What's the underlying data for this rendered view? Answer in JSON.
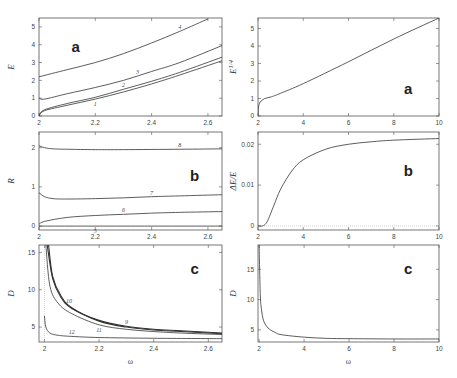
{
  "chart_data": [
    {
      "id": "left-a",
      "type": "line",
      "panel_label": "a",
      "xlabel": "",
      "ylabel": "E",
      "xlim": [
        2,
        2.65
      ],
      "ylim": [
        0,
        5.5
      ],
      "xticks": [
        "2",
        "2.2",
        "2.4",
        "2.6"
      ],
      "yticks": [
        "0",
        "1",
        "2",
        "3",
        "4",
        "5"
      ],
      "series": [
        {
          "name": "1",
          "x": [
            2.0,
            2.02,
            2.1,
            2.2,
            2.3,
            2.4,
            2.5,
            2.65
          ],
          "y": [
            0.0,
            0.3,
            0.6,
            0.95,
            1.35,
            1.8,
            2.3,
            3.1
          ]
        },
        {
          "name": "2",
          "x": [
            2.0,
            2.02,
            2.1,
            2.2,
            2.3,
            2.4,
            2.5,
            2.65
          ],
          "y": [
            0.05,
            0.35,
            0.7,
            1.05,
            1.5,
            1.95,
            2.45,
            3.3
          ]
        },
        {
          "name": "3",
          "x": [
            2.0,
            2.02,
            2.1,
            2.2,
            2.3,
            2.4,
            2.5,
            2.65
          ],
          "y": [
            1.0,
            0.95,
            1.25,
            1.6,
            2.0,
            2.5,
            3.0,
            3.95
          ]
        },
        {
          "name": "4",
          "x": [
            2.0,
            2.1,
            2.2,
            2.3,
            2.4,
            2.5,
            2.6
          ],
          "y": [
            2.2,
            2.6,
            3.0,
            3.5,
            4.1,
            4.75,
            5.45
          ]
        }
      ]
    },
    {
      "id": "left-b",
      "type": "line",
      "panel_label": "b",
      "xlabel": "",
      "ylabel": "R",
      "xlim": [
        2,
        2.65
      ],
      "ylim": [
        -0.1,
        2.4
      ],
      "xticks": [
        "2",
        "2.2",
        "2.4",
        "2.6"
      ],
      "yticks": [
        "0",
        "1",
        "2"
      ],
      "series": [
        {
          "name": "5",
          "x": [
            2.0,
            2.65
          ],
          "y": [
            0.0,
            0.0
          ]
        },
        {
          "name": "6",
          "x": [
            2.0,
            2.02,
            2.1,
            2.2,
            2.3,
            2.4,
            2.5,
            2.65
          ],
          "y": [
            0.05,
            0.12,
            0.22,
            0.27,
            0.3,
            0.33,
            0.35,
            0.37
          ]
        },
        {
          "name": "7",
          "x": [
            2.0,
            2.02,
            2.05,
            2.1,
            2.2,
            2.3,
            2.4,
            2.5,
            2.65
          ],
          "y": [
            0.85,
            0.75,
            0.7,
            0.69,
            0.7,
            0.72,
            0.75,
            0.77,
            0.8
          ]
        },
        {
          "name": "8",
          "x": [
            2.0,
            2.02,
            2.05,
            2.1,
            2.2,
            2.3,
            2.5,
            2.65
          ],
          "y": [
            2.05,
            2.0,
            1.97,
            1.96,
            1.95,
            1.95,
            1.96,
            1.97
          ]
        }
      ]
    },
    {
      "id": "left-c",
      "type": "line",
      "panel_label": "c",
      "xlabel": "ω",
      "ylabel": "D",
      "xlim": [
        1.98,
        2.65
      ],
      "ylim": [
        3,
        16
      ],
      "xticks": [
        "2",
        "2.2",
        "2.4",
        "2.6"
      ],
      "yticks": [
        "5",
        "10",
        "15"
      ],
      "series": [
        {
          "name": "9",
          "x": [
            2.01,
            2.03,
            2.06,
            2.1,
            2.2,
            2.3,
            2.4,
            2.5,
            2.65
          ],
          "y": [
            16,
            11.5,
            9,
            7.5,
            5.9,
            5.1,
            4.7,
            4.5,
            4.2
          ]
        },
        {
          "name": "10",
          "x": [
            2.015,
            2.03,
            2.06,
            2.1,
            2.2,
            2.3,
            2.4,
            2.5,
            2.65
          ],
          "y": [
            16,
            11.8,
            9.2,
            7.6,
            5.8,
            5.0,
            4.6,
            4.4,
            4.1
          ]
        },
        {
          "name": "11",
          "x": [
            2.005,
            2.02,
            2.05,
            2.1,
            2.2,
            2.3,
            2.4,
            2.5,
            2.65
          ],
          "y": [
            16,
            10.5,
            8.2,
            6.8,
            5.3,
            4.7,
            4.4,
            4.2,
            4.0
          ]
        },
        {
          "name": "12",
          "x": [
            2.0,
            2.005,
            2.02,
            2.05,
            2.1,
            2.2,
            2.4,
            2.65
          ],
          "y": [
            6.5,
            5.0,
            4.2,
            3.9,
            3.75,
            3.6,
            3.5,
            3.45
          ]
        }
      ]
    },
    {
      "id": "right-a",
      "type": "line",
      "panel_label": "a",
      "xlabel": "",
      "ylabel": "E^{1/4}",
      "xlim": [
        2,
        10
      ],
      "ylim": [
        0,
        5.6
      ],
      "xticks": [
        "2",
        "4",
        "6",
        "8",
        "10"
      ],
      "yticks": [
        "0",
        "1",
        "2",
        "3",
        "4",
        "5"
      ],
      "series": [
        {
          "name": "E^1/4",
          "x": [
            2.0,
            2.02,
            2.1,
            2.3,
            2.6,
            3,
            4,
            6,
            8,
            10
          ],
          "y": [
            0.0,
            0.5,
            0.8,
            1.0,
            1.1,
            1.3,
            1.85,
            3.1,
            4.4,
            5.6
          ]
        }
      ]
    },
    {
      "id": "right-b",
      "type": "line",
      "panel_label": "b",
      "xlabel": "",
      "ylabel": "ΔE/E",
      "xlim": [
        2,
        10
      ],
      "ylim": [
        -0.001,
        0.023
      ],
      "xticks": [
        "2",
        "4",
        "6",
        "8",
        "10"
      ],
      "yticks": [
        "0",
        "0.01",
        "0.02"
      ],
      "series": [
        {
          "name": "ΔE/E",
          "x": [
            2.0,
            2.2,
            2.4,
            2.7,
            3,
            3.5,
            4,
            5,
            6,
            7,
            8,
            10
          ],
          "y": [
            0.0,
            0.0,
            0.001,
            0.005,
            0.009,
            0.0135,
            0.0162,
            0.0188,
            0.02,
            0.0206,
            0.021,
            0.0214
          ]
        }
      ]
    },
    {
      "id": "right-c",
      "type": "line",
      "panel_label": "c",
      "xlabel": "ω",
      "ylabel": "D",
      "xlim": [
        1.95,
        10
      ],
      "ylim": [
        3,
        19
      ],
      "xticks": [
        "2",
        "4",
        "6",
        "8",
        "10"
      ],
      "yticks": [
        "5",
        "10",
        "15"
      ],
      "series": [
        {
          "name": "D",
          "x": [
            2.0,
            2.05,
            2.1,
            2.2,
            2.4,
            2.7,
            3,
            4,
            5,
            6,
            8,
            10
          ],
          "y": [
            19,
            11,
            8.5,
            6.5,
            5.3,
            4.6,
            4.2,
            3.8,
            3.6,
            3.55,
            3.5,
            3.5
          ]
        }
      ]
    }
  ],
  "figure": {
    "left_x_axis_label": "ω",
    "right_x_axis_label": "ω"
  }
}
